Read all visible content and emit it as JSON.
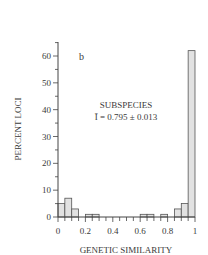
{
  "chart_data": {
    "type": "bar",
    "panel_label": "b",
    "title": "",
    "annotation": [
      "SUBSPECIES",
      "Ī = 0.795 ± 0.013"
    ],
    "xlabel": "GENETIC SIMILARITY",
    "ylabel": "PERCENT LOCI",
    "xlim": [
      0,
      1
    ],
    "ylim": [
      0,
      65
    ],
    "xticks": [
      "0",
      "0.2",
      "0.4",
      "0.6",
      "0.8",
      "1"
    ],
    "yticks": [
      "0",
      "10",
      "20",
      "30",
      "40",
      "50",
      "60"
    ],
    "bin_width": 0.05,
    "bins": [
      0.0,
      0.05,
      0.1,
      0.15,
      0.2,
      0.25,
      0.3,
      0.35,
      0.4,
      0.45,
      0.5,
      0.55,
      0.6,
      0.65,
      0.7,
      0.75,
      0.8,
      0.85,
      0.9,
      0.95
    ],
    "values": [
      5,
      7,
      3,
      0,
      1,
      1,
      0,
      0,
      0,
      0,
      0,
      0,
      1,
      1,
      0,
      1,
      0,
      3,
      5,
      62
    ],
    "bar_fill": "#e2e2e2",
    "bar_stroke": "#555555",
    "grid": false,
    "legend": "none"
  }
}
